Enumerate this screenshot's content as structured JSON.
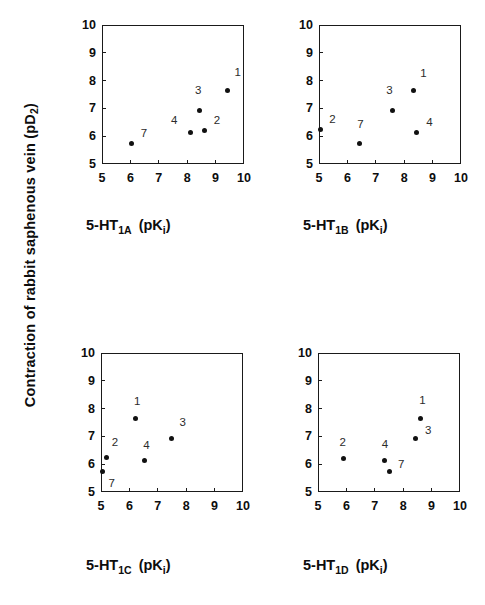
{
  "figure": {
    "ylabel_text": "Contraction of rabbit saphenous vein (pD",
    "ylabel_sub": "2",
    "ylabel_tail": ")"
  },
  "axis": {
    "y_ticks": [
      "5",
      "6",
      "7",
      "8",
      "9",
      "10"
    ],
    "x_ticks": [
      "5",
      "6",
      "7",
      "8",
      "9",
      "10"
    ],
    "xlim": [
      5,
      10
    ],
    "ylim": [
      5,
      10
    ]
  },
  "chart_data": [
    {
      "type": "scatter",
      "id": "panel-1a",
      "title": "5-HT1A (pKi)",
      "title_prefix": "5-HT",
      "title_sub": "1A",
      "title_paren_open": "(pK",
      "title_isub": "i",
      "title_paren_close": ")",
      "xlabel": "5-HT1A (pKi)",
      "ylabel": "Contraction of rabbit saphenous vein (pD2)",
      "xlim": [
        5,
        10
      ],
      "ylim": [
        5,
        10
      ],
      "grid": false,
      "points": [
        {
          "label": "1",
          "x": 9.42,
          "y": 7.65,
          "lx": 10,
          "ly": 20
        },
        {
          "label": "3",
          "x": 8.45,
          "y": 6.93,
          "lx": -2,
          "ly": 22
        },
        {
          "label": "2",
          "x": 8.62,
          "y": 6.22,
          "lx": 12,
          "ly": 12
        },
        {
          "label": "4",
          "x": 8.1,
          "y": 6.12,
          "lx": -16,
          "ly": 15
        },
        {
          "label": "7",
          "x": 6.05,
          "y": 5.72,
          "lx": 12,
          "ly": 13
        }
      ]
    },
    {
      "type": "scatter",
      "id": "panel-1b",
      "title": "5-HT1B (pKi)",
      "title_prefix": "5-HT",
      "title_sub": "1B",
      "title_paren_open": "(pK",
      "title_isub": "i",
      "title_paren_close": ")",
      "xlabel": "5-HT1B (pKi)",
      "ylabel": "Contraction of rabbit saphenous vein (pD2)",
      "xlim": [
        5,
        10
      ],
      "ylim": [
        5,
        10
      ],
      "grid": false,
      "points": [
        {
          "label": "1",
          "x": 8.32,
          "y": 7.65,
          "lx": 10,
          "ly": 19
        },
        {
          "label": "3",
          "x": 7.58,
          "y": 6.93,
          "lx": -3,
          "ly": 22
        },
        {
          "label": "4",
          "x": 8.42,
          "y": 6.15,
          "lx": 13,
          "ly": 12
        },
        {
          "label": "2",
          "x": 5.04,
          "y": 6.25,
          "lx": 12,
          "ly": 12
        },
        {
          "label": "7",
          "x": 6.42,
          "y": 5.73,
          "lx": 1,
          "ly": 22
        }
      ]
    },
    {
      "type": "scatter",
      "id": "panel-1c",
      "title": "5-HT1C (pKi)",
      "title_prefix": "5-HT",
      "title_sub": "1C",
      "title_paren_open": "(pK",
      "title_isub": "i",
      "title_paren_close": ")",
      "xlabel": "5-HT1C (pKi)",
      "ylabel": "Contraction of rabbit saphenous vein (pD2)",
      "xlim": [
        5,
        10
      ],
      "ylim": [
        5,
        10
      ],
      "grid": false,
      "points": [
        {
          "label": "1",
          "x": 6.2,
          "y": 7.63,
          "lx": 2,
          "ly": 20
        },
        {
          "label": "3",
          "x": 7.48,
          "y": 6.93,
          "lx": 11,
          "ly": 18
        },
        {
          "label": "2",
          "x": 5.2,
          "y": 6.25,
          "lx": 8,
          "ly": 17
        },
        {
          "label": "4",
          "x": 6.52,
          "y": 6.13,
          "lx": 2,
          "ly": 18
        },
        {
          "label": "7",
          "x": 5.05,
          "y": 5.72,
          "lx": 9,
          "ly": -9
        }
      ]
    },
    {
      "type": "scatter",
      "id": "panel-1d",
      "title": "5-HT1D (pKi)",
      "title_prefix": "5-HT",
      "title_sub": "1D",
      "title_paren_open": "(pK",
      "title_isub": "i",
      "title_paren_close": ")",
      "xlabel": "5-HT1D (pKi)",
      "ylabel": "Contraction of rabbit saphenous vein (pD2)",
      "xlim": [
        5,
        10
      ],
      "ylim": [
        5,
        10
      ],
      "grid": false,
      "points": [
        {
          "label": "1",
          "x": 8.6,
          "y": 7.65,
          "lx": 2,
          "ly": 20
        },
        {
          "label": "3",
          "x": 8.45,
          "y": 6.93,
          "lx": 12,
          "ly": 10
        },
        {
          "label": "2",
          "x": 5.9,
          "y": 6.22,
          "lx": -1,
          "ly": 18
        },
        {
          "label": "4",
          "x": 7.35,
          "y": 6.13,
          "lx": 0,
          "ly": 19
        },
        {
          "label": "7",
          "x": 7.5,
          "y": 5.75,
          "lx": 12,
          "ly": 9
        }
      ]
    }
  ]
}
